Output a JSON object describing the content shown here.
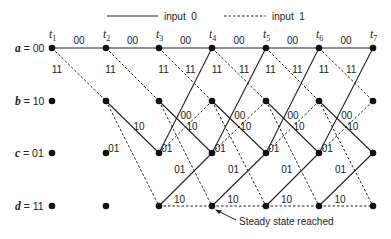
{
  "legend": {
    "solid_label": "input  0",
    "dashed_label": "input  1"
  },
  "time_labels": [
    "t1",
    "t2",
    "t3",
    "t4",
    "t5",
    "t6",
    "t7"
  ],
  "states": [
    {
      "name": "a",
      "code": "00"
    },
    {
      "name": "b",
      "code": "10"
    },
    {
      "name": "c",
      "code": "01"
    },
    {
      "name": "d",
      "code": "11"
    }
  ],
  "transitions": [
    {
      "from": "a",
      "to": "a",
      "input": 0,
      "output": "00"
    },
    {
      "from": "a",
      "to": "b",
      "input": 1,
      "output": "11"
    },
    {
      "from": "b",
      "to": "c",
      "input": 0,
      "output": "10"
    },
    {
      "from": "b",
      "to": "d",
      "input": 1,
      "output": "01"
    },
    {
      "from": "c",
      "to": "a",
      "input": 0,
      "output": "11"
    },
    {
      "from": "c",
      "to": "b",
      "input": 1,
      "output": "00"
    },
    {
      "from": "d",
      "to": "c",
      "input": 0,
      "output": "01"
    },
    {
      "from": "d",
      "to": "d",
      "input": 1,
      "output": "10"
    }
  ],
  "annotation": "Steady state reached",
  "colors": {
    "line": "#222222",
    "node": "#111111",
    "background": "#ffffff"
  }
}
